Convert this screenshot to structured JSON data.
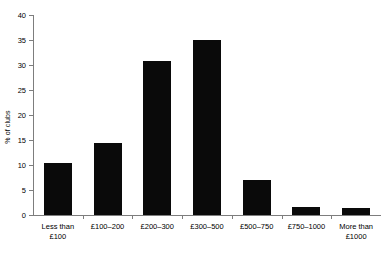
{
  "chart_data": {
    "type": "bar",
    "title": "",
    "xlabel": "",
    "ylabel": "% of clubs",
    "categories": [
      "Less than\n£100",
      "£100–200",
      "£200–300",
      "£300–500",
      "£500–750",
      "£750–1000",
      "More than\n£1000"
    ],
    "values": [
      10.4,
      14.5,
      30.8,
      35.1,
      7.0,
      1.7,
      1.4
    ],
    "ylim": [
      0,
      40
    ],
    "yticks": [
      0,
      5,
      10,
      15,
      20,
      25,
      30,
      35,
      40
    ],
    "ytick_labels": [
      "0",
      "5",
      "10",
      "15",
      "20",
      "25",
      "30",
      "35",
      "40"
    ],
    "grid": false,
    "legend": false,
    "bar_color": "#0a0a0a",
    "axis_color": "#7d7d7d"
  }
}
